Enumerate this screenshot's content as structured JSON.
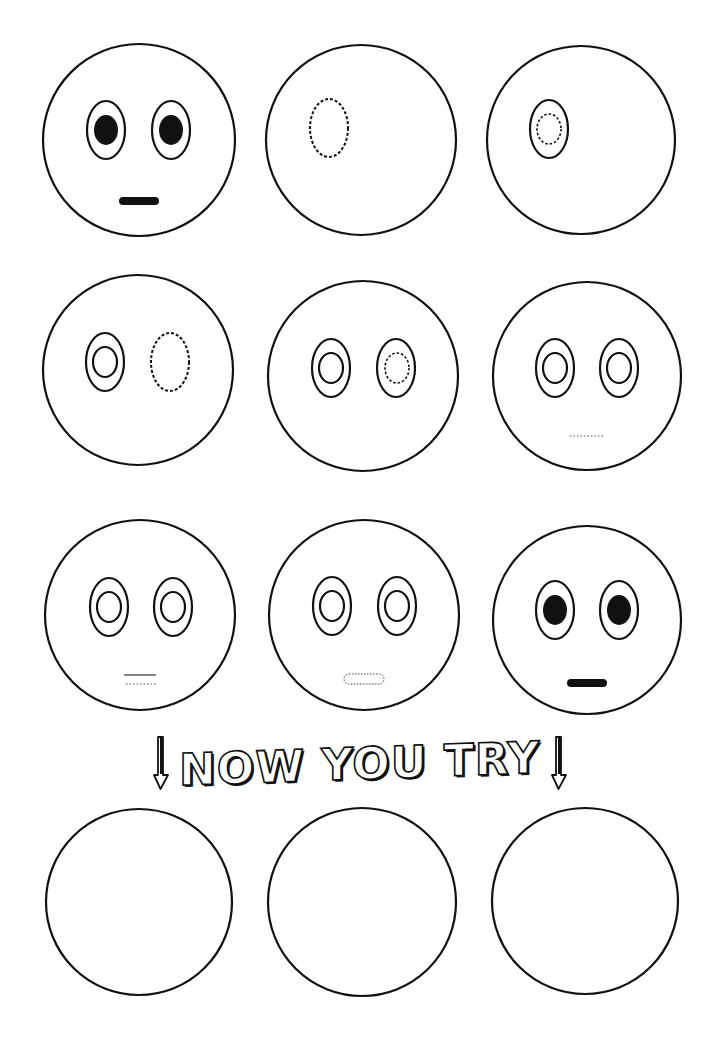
{
  "worksheet": {
    "title": "How to draw a face, step by step",
    "stroke_color": "#111111",
    "background_color": "#ffffff",
    "steps": [
      {
        "step": 1,
        "description": "Completed example face: two eyes with filled pupils and a flat mouth",
        "cx": 138,
        "cy": 139,
        "r": 96
      },
      {
        "step": 2,
        "description": "Blank circle with dotted guide for left eye outline",
        "cx": 360,
        "cy": 139,
        "r": 95
      },
      {
        "step": 3,
        "description": "Left eye outline with dotted guide for inner ring",
        "cx": 580,
        "cy": 139,
        "r": 94
      },
      {
        "step": 4,
        "description": "Left eye done, dotted guide for right eye outline",
        "cx": 138,
        "cy": 370,
        "r": 95
      },
      {
        "step": 5,
        "description": "Right eye outline with dotted guide for inner ring",
        "cx": 363,
        "cy": 376,
        "r": 95
      },
      {
        "step": 6,
        "description": "Both eyes done, dotted guide for mouth",
        "cx": 587,
        "cy": 376,
        "r": 94
      },
      {
        "step": 7,
        "description": "Mouth top line with dotted guide underneath",
        "cx": 140,
        "cy": 615,
        "r": 95
      },
      {
        "step": 8,
        "description": "Dotted rounded mouth outline",
        "cx": 363,
        "cy": 614,
        "r": 95
      },
      {
        "step": 9,
        "description": "Finished face: filled pupils and filled mouth",
        "cx": 587,
        "cy": 620,
        "r": 94
      }
    ],
    "banner": {
      "text": "NOW YOU TRY",
      "left_arrow": "down-arrow-icon",
      "right_arrow": "down-arrow-icon"
    },
    "practice": [
      {
        "label": "Practice circle 1",
        "cx": 139,
        "cy": 902,
        "r": 93
      },
      {
        "label": "Practice circle 2",
        "cx": 362,
        "cy": 902,
        "r": 94
      },
      {
        "label": "Practice circle 3",
        "cx": 585,
        "cy": 901,
        "r": 93
      }
    ]
  }
}
